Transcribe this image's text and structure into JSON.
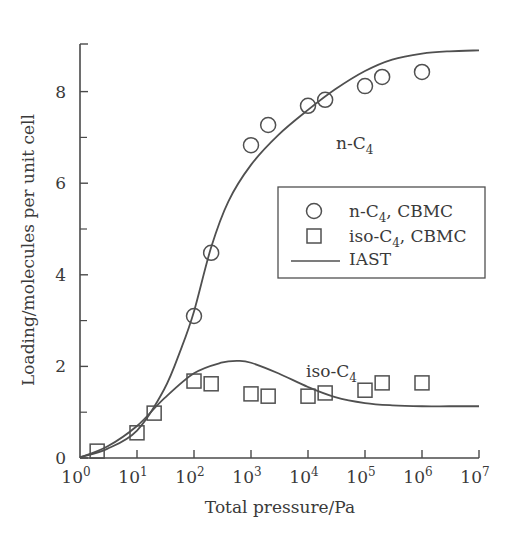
{
  "chart_data": {
    "type": "scatter",
    "title": "",
    "xlabel": "Total pressure/Pa",
    "ylabel": "Loading/molecules per unit cell",
    "xscale": "log",
    "xlim": [
      1,
      10000000
    ],
    "ylim": [
      0,
      9
    ],
    "x_ticks": [
      {
        "value": 1,
        "base": "10",
        "exp": "0"
      },
      {
        "value": 10,
        "base": "10",
        "exp": "1"
      },
      {
        "value": 100,
        "base": "10",
        "exp": "2"
      },
      {
        "value": 1000,
        "base": "10",
        "exp": "3"
      },
      {
        "value": 10000,
        "base": "10",
        "exp": "4"
      },
      {
        "value": 100000,
        "base": "10",
        "exp": "5"
      },
      {
        "value": 1000000,
        "base": "10",
        "exp": "6"
      },
      {
        "value": 10000000,
        "base": "10",
        "exp": "7"
      }
    ],
    "y_ticks": [
      0,
      2,
      4,
      6,
      8
    ],
    "y_minor_ticks": [
      1,
      3,
      5,
      7
    ],
    "grid": false,
    "legend_position": "center-right",
    "legend": [
      {
        "label_main": "n-C",
        "label_sub": "4",
        "label_tail": ", CBMC",
        "marker": "circle"
      },
      {
        "label_main": "iso-C",
        "label_sub": "4",
        "label_tail": ", CBMC",
        "marker": "square"
      },
      {
        "label_main": "IAST",
        "label_sub": "",
        "label_tail": "",
        "marker": "line"
      }
    ],
    "annotations": [
      {
        "text": "n-C",
        "sub": "4",
        "x": 3000,
        "y": 7.2
      },
      {
        "text": "iso-C",
        "sub": "4",
        "x": 9000,
        "y": 2.2
      }
    ],
    "series": [
      {
        "name": "n-C4, CBMC",
        "marker": "circle",
        "x": [
          100,
          200,
          1000,
          2000,
          10000,
          20000,
          100000,
          200000,
          1000000
        ],
        "y": [
          3.1,
          4.48,
          6.83,
          7.27,
          7.69,
          7.82,
          8.12,
          8.32,
          8.43
        ]
      },
      {
        "name": "iso-C4, CBMC",
        "marker": "square",
        "x": [
          2,
          10,
          20,
          100,
          200,
          1000,
          2000,
          10000,
          20000,
          100000,
          200000,
          1000000
        ],
        "y": [
          0.15,
          0.55,
          0.98,
          1.68,
          1.62,
          1.4,
          1.35,
          1.35,
          1.42,
          1.48,
          1.64,
          1.64
        ]
      },
      {
        "name": "IAST n-C4",
        "marker": "line",
        "x": [
          1,
          3,
          10,
          30,
          60,
          100,
          200,
          400,
          1000,
          3000,
          10000,
          30000,
          100000,
          300000,
          1000000,
          3000000,
          10000000
        ],
        "y": [
          0.02,
          0.2,
          0.6,
          1.5,
          2.4,
          3.2,
          4.6,
          5.6,
          6.4,
          7.05,
          7.6,
          8.05,
          8.45,
          8.7,
          8.83,
          8.88,
          8.9
        ]
      },
      {
        "name": "IAST iso-C4",
        "marker": "line",
        "x": [
          1,
          3,
          10,
          30,
          100,
          300,
          600,
          1000,
          3000,
          10000,
          30000,
          100000,
          300000,
          1000000,
          3000000,
          10000000
        ],
        "y": [
          0.01,
          0.25,
          0.7,
          1.3,
          1.85,
          2.08,
          2.12,
          2.08,
          1.85,
          1.55,
          1.33,
          1.2,
          1.15,
          1.13,
          1.13,
          1.13
        ]
      }
    ]
  }
}
